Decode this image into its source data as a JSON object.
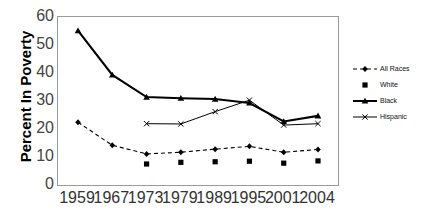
{
  "chart_data": {
    "type": "line",
    "title": "",
    "xlabel": "",
    "ylabel": "Percent In Poverty",
    "categories": [
      "1959",
      "1967",
      "1973",
      "1979",
      "1989",
      "1995",
      "2001",
      "2004"
    ],
    "ylim": [
      0,
      60
    ],
    "y_ticks": [
      0,
      10,
      20,
      30,
      40,
      50,
      60
    ],
    "grid": false,
    "legend_position": "right",
    "series": [
      {
        "name": "All Races",
        "style": "dashed-line-with-markers",
        "marker": "diamond",
        "values": [
          22.4,
          14.2,
          11.1,
          11.7,
          12.8,
          13.8,
          11.7,
          12.7
        ]
      },
      {
        "name": "White",
        "style": "markers-only",
        "marker": "square",
        "values": [
          null,
          null,
          7.5,
          8.1,
          8.3,
          8.5,
          7.8,
          8.6
        ]
      },
      {
        "name": "Black",
        "style": "solid-thick-line-with-markers",
        "marker": "triangle",
        "values": [
          55.1,
          39.3,
          31.4,
          31.0,
          30.7,
          29.3,
          22.7,
          24.7
        ]
      },
      {
        "name": "Hispanic",
        "style": "solid-thin-line-with-markers",
        "marker": "cross",
        "values": [
          null,
          null,
          21.9,
          21.8,
          26.2,
          30.3,
          21.4,
          21.9
        ]
      }
    ]
  },
  "legend": {
    "items": [
      {
        "label": "All Races"
      },
      {
        "label": "White"
      },
      {
        "label": "Black"
      },
      {
        "label": "Hispanic"
      }
    ]
  },
  "axes": {
    "y_title": "Percent In Poverty",
    "y_tick_labels": [
      "60",
      "50",
      "40",
      "30",
      "20",
      "10",
      "0"
    ],
    "x_tick_labels": [
      "1959",
      "1967",
      "1973",
      "1979",
      "1989",
      "1995",
      "2001",
      "2004"
    ]
  },
  "colors": {
    "line": "#000000",
    "frame": "#9a9a9a",
    "tick_text": "#3a3a3a",
    "title_text": "#000000"
  }
}
